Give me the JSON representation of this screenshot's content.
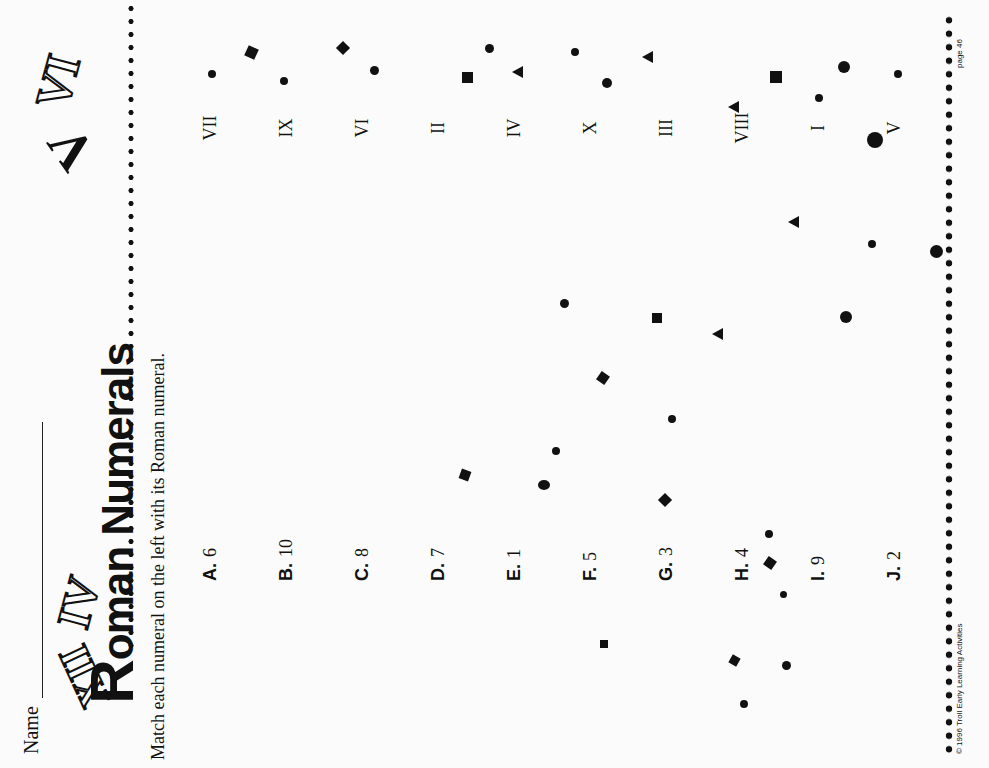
{
  "header": {
    "name_label": "Name",
    "title_first": "R",
    "title_rest": "oman Numerals",
    "instructions": "Match each numeral on the left with its Roman numeral."
  },
  "decorations": [
    "XII",
    "IV",
    "V",
    "VI"
  ],
  "left_items": [
    {
      "letter": "A.",
      "value": "6"
    },
    {
      "letter": "B.",
      "value": "10"
    },
    {
      "letter": "C.",
      "value": "8"
    },
    {
      "letter": "D.",
      "value": "7"
    },
    {
      "letter": "E.",
      "value": "1"
    },
    {
      "letter": "F.",
      "value": "5"
    },
    {
      "letter": "G.",
      "value": "3"
    },
    {
      "letter": "H.",
      "value": "4"
    },
    {
      "letter": "I.",
      "value": "9"
    },
    {
      "letter": "J.",
      "value": "2"
    }
  ],
  "right_items": [
    "VII",
    "IX",
    "VI",
    "II",
    "IV",
    "X",
    "III",
    "VIII",
    "I",
    "V"
  ],
  "footer": {
    "copyright": "© 1996 Troll Early Learning Activities",
    "page": "page 46"
  }
}
